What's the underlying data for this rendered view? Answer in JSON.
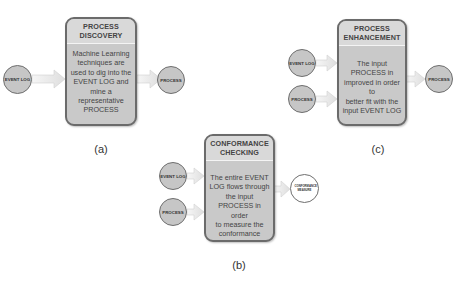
{
  "panels": {
    "a": {
      "caption": "(a)",
      "title_line1": "PROCESS",
      "title_line2": "DISCOVERY",
      "body": [
        "Machine Learning",
        "techniques are",
        "used to dig into the",
        "EVENT LOG and",
        "mine a",
        "representative",
        "PROCESS"
      ],
      "inputs": [
        "EVENT LOG"
      ],
      "output": "PROCESS"
    },
    "b": {
      "caption": "(b)",
      "title_line1": "CONFORMANCE",
      "title_line2": "CHECKING",
      "body": [
        "The entire EVENT",
        "LOG flows through",
        "the input",
        "PROCESS in order",
        "to measure the",
        "conformance"
      ],
      "inputs": [
        "EVENT LOG",
        "PROCESS"
      ],
      "output": "CONFORMANCE MEASURE"
    },
    "c": {
      "caption": "(c)",
      "title_line1": "PROCESS",
      "title_line2": "ENHANCEMENT",
      "body": [
        "The input",
        "PROCESS in",
        "improved in order to",
        "better fit with the",
        "input EVENT LOG"
      ],
      "inputs": [
        "EVENT LOG",
        "PROCESS"
      ],
      "output": "PROCESS"
    }
  },
  "colors": {
    "box_fill": "#c9c9c9",
    "box_header": "#d9d9d9",
    "box_border": "#6b6b6b",
    "node_fill": "#c6c6c6",
    "output_node_fill_b": "#ffffff",
    "arrow_fill": "#ececec"
  }
}
